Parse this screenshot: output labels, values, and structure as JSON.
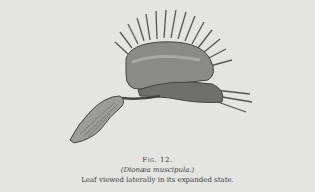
{
  "illustration": {
    "subject": "Venus flytrap leaf, lateral view",
    "icon": "botanical-engraving"
  },
  "caption": {
    "figure": "Fig. 12.",
    "species": "(Dionæa muscipula.)",
    "description": "Leaf viewed laterally in its expanded state."
  },
  "colors": {
    "paper": "#e4e4e2",
    "ink": "#3a3a3a"
  }
}
